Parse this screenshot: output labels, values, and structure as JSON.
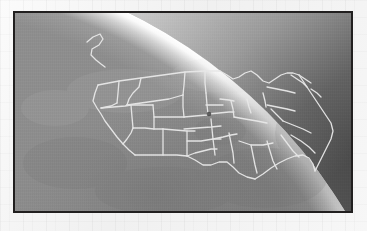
{
  "document": {
    "background_color": "#f4f4f4",
    "caption": ""
  },
  "frame": {
    "border_color": "#211f1f",
    "border_width_px": 2,
    "x": 13,
    "y": 11,
    "width": 340,
    "height": 202
  },
  "image": {
    "title": "Earth limb from orbit with United States state boundaries overlay",
    "kind": "satellite-oblique-view",
    "palette": {
      "space": "#4b4b4b",
      "atmosphere_glow": "#f2f2f2",
      "earth_land": "#8d8d8d",
      "earth_land_dark": "#7e7e7e",
      "ocean": "#838383",
      "boundary_line": "#e8e8e8",
      "marker_dot": "#4a4a4a"
    },
    "limb": {
      "description": "Earth horizon arc sweeping from upper-left down to lower-right",
      "glow_band_width_px": 22
    },
    "marker": {
      "label": "",
      "x": 209,
      "y": 110,
      "radius_px": 2
    },
    "overlay": {
      "name": "US state boundaries",
      "line_color": "#e8e8e8",
      "line_width_px": 1.3
    }
  },
  "geo": {
    "coastline_nw": "M 78,47 L 84,38 L 92,33 L 96,38 L 92,44 L 86,47 L 88,52 L 96,57 L 100,62 L 104,63",
    "us_north_border": "M 104,79 L 128,75 L 152,72 L 176,69 L 196,67 L 208,68 L 216,71 L 224,73",
    "us_outline": "M 104,79 L 104,93 L 100,100 L 103,108 L 108,118 L 112,126 L 118,134 L 124,140 L 130,146 L 136,150 L 146,150 L 158,150 L 168,150 L 176,150",
    "states_count": 48
  },
  "chart_data": {
    "type": "map",
    "projection": "oblique perspective (from orbit)",
    "features": [
      {
        "name": "continental-us-states",
        "type": "polyline-group",
        "count": 48
      },
      {
        "name": "canada-pacific-coastline",
        "type": "polyline",
        "count": 1
      },
      {
        "name": "us-mexico-border",
        "type": "polyline",
        "count": 1
      },
      {
        "name": "gulf-coast",
        "type": "polyline",
        "count": 1
      },
      {
        "name": "atlantic-coast",
        "type": "polyline",
        "count": 1
      },
      {
        "name": "great-lakes",
        "type": "polyline",
        "count": 1
      },
      {
        "name": "location-marker",
        "type": "point",
        "count": 1
      }
    ],
    "legend": [],
    "annotations": []
  }
}
